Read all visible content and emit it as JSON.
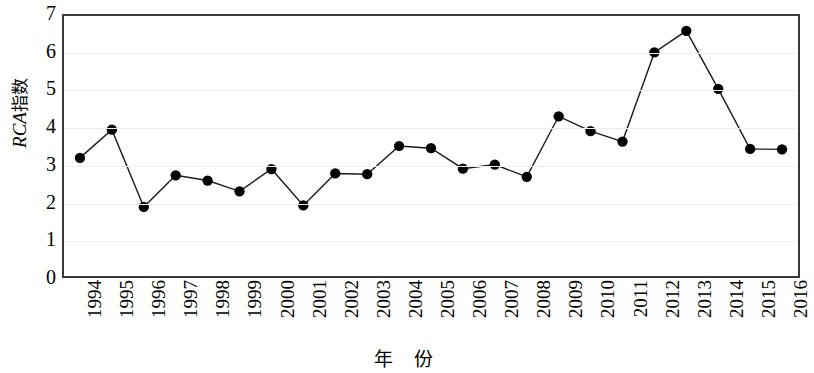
{
  "chart_data": {
    "type": "line",
    "title": "",
    "xlabel": "年 份",
    "ylabel": "RCA指数",
    "ylabel_latin": "RCA",
    "ylabel_cjk": "指数",
    "ylim": [
      0,
      7
    ],
    "yticks": [
      7,
      6,
      5,
      4,
      3,
      2,
      1,
      0
    ],
    "grid": true,
    "legend": "none",
    "marker": "filled-circle",
    "line_color": "#1a1a1a",
    "marker_color": "#000000",
    "grid_color": "#ededed",
    "frame_color": "#3a3a3a",
    "categories": [
      "1994",
      "1995",
      "1996",
      "1997",
      "1998",
      "1999",
      "2000",
      "2001",
      "2002",
      "2003",
      "2004",
      "2005",
      "2006",
      "2007",
      "2008",
      "2009",
      "2010",
      "2011",
      "2012",
      "2013",
      "2014",
      "2015",
      "2016"
    ],
    "values": [
      3.18,
      3.94,
      1.86,
      2.71,
      2.57,
      2.28,
      2.88,
      1.9,
      2.76,
      2.74,
      3.5,
      3.44,
      2.89,
      3.0,
      2.67,
      4.3,
      3.9,
      3.62,
      6.02,
      6.6,
      5.04,
      3.42,
      3.41
    ],
    "series": [
      {
        "name": "RCA指数",
        "values": [
          3.18,
          3.94,
          1.86,
          2.71,
          2.57,
          2.28,
          2.88,
          1.9,
          2.76,
          2.74,
          3.5,
          3.44,
          2.89,
          3.0,
          2.67,
          4.3,
          3.9,
          3.62,
          6.02,
          6.6,
          5.04,
          3.42,
          3.41
        ]
      }
    ]
  }
}
